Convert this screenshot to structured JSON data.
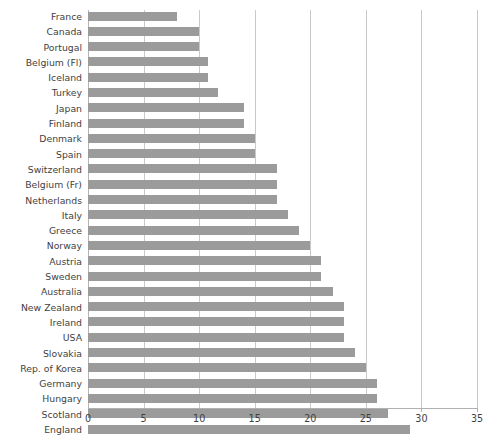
{
  "chart_data": {
    "type": "bar",
    "orientation": "horizontal",
    "title": "",
    "subtitle": "",
    "xlabel": "",
    "ylabel": "",
    "xlim": [
      0,
      35
    ],
    "xticks": [
      0,
      5,
      10,
      15,
      20,
      25,
      30,
      35
    ],
    "grid": "vertical",
    "legend": "none",
    "bar_color": "#9b9b9b",
    "gridline_color": "#c9c9c9",
    "label_color": "#3f3f3f",
    "categories": [
      "France",
      "Canada",
      "Portugal",
      "Belgium (Fl)",
      "Iceland",
      "Turkey",
      "Japan",
      "Finland",
      "Denmark",
      "Spain",
      "Switzerland",
      "Belgium (Fr)",
      "Netherlands",
      "Italy",
      "Greece",
      "Norway",
      "Austria",
      "Sweden",
      "Australia",
      "New Zealand",
      "Ireland",
      "USA",
      "Slovakia",
      "Rep. of Korea",
      "Germany",
      "Hungary",
      "Scotland",
      "England"
    ],
    "values": [
      8,
      10,
      10,
      10.8,
      10.8,
      11.7,
      14,
      14,
      15,
      15,
      17,
      17,
      17,
      18,
      19,
      20,
      21,
      21,
      22,
      23,
      23,
      23,
      24,
      25,
      26,
      26,
      27,
      29
    ]
  }
}
